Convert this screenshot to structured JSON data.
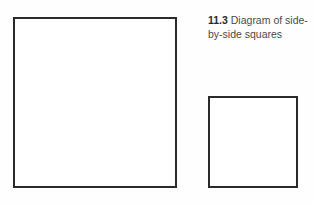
{
  "caption": {
    "number": "11.3",
    "text": "Diagram of side-by-side squares"
  },
  "shapes": [
    {
      "name": "large-square",
      "type": "square"
    },
    {
      "name": "small-square",
      "type": "square"
    }
  ],
  "colors": {
    "stroke": "#2a2a2a",
    "fill": "#ffffff",
    "caption_text": "#4a4a4a"
  }
}
